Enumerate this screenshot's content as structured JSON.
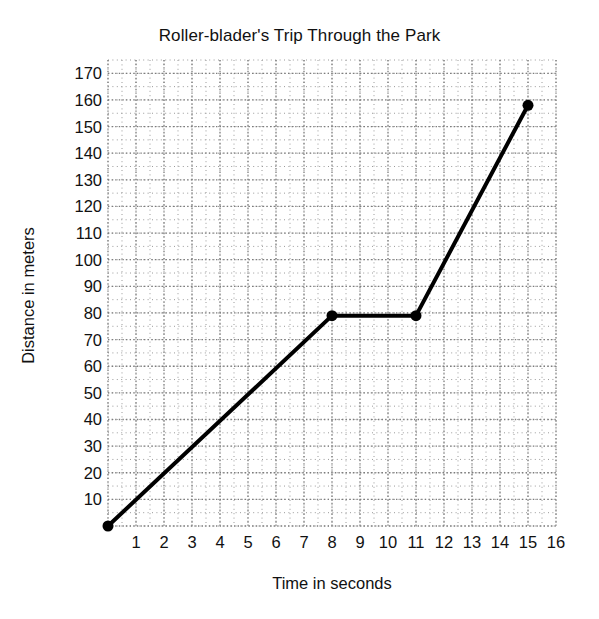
{
  "chart_data": {
    "type": "line",
    "title": "Roller-blader's Trip Through the Park",
    "xlabel": "Time in seconds",
    "ylabel": "Distance in meters",
    "x": [
      0,
      8,
      11,
      15
    ],
    "values": [
      0,
      79,
      79,
      158
    ],
    "points": [
      {
        "x": 0,
        "y": 0
      },
      {
        "x": 8,
        "y": 79
      },
      {
        "x": 11,
        "y": 79
      },
      {
        "x": 15,
        "y": 158
      }
    ],
    "xlim": [
      0,
      16
    ],
    "ylim": [
      0,
      175
    ],
    "xticks": [
      1,
      2,
      3,
      4,
      5,
      6,
      7,
      8,
      9,
      10,
      11,
      12,
      13,
      14,
      15,
      16
    ],
    "yticks": [
      10,
      20,
      30,
      40,
      50,
      60,
      70,
      80,
      90,
      100,
      110,
      120,
      130,
      140,
      150,
      160,
      170
    ],
    "x_minor_step": 0.5,
    "y_minor_step": 5,
    "grid": true,
    "grid_style": "dotted",
    "legend": null,
    "line_color": "#000000",
    "line_width": 4,
    "marker": "circle",
    "marker_size": 11,
    "grid_color": "#9a9a9a",
    "background": "#ffffff"
  }
}
